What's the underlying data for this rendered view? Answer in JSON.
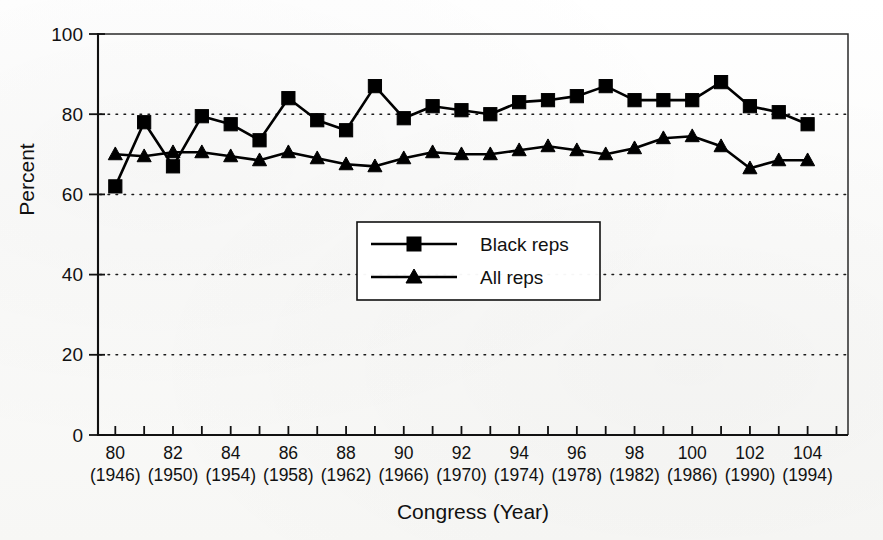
{
  "figure": {
    "background_color": "#ffffff",
    "ink_color": "#000000"
  },
  "chart_data": {
    "type": "line",
    "title": "",
    "xlabel": "Congress (Year)",
    "ylabel": "Percent",
    "ylim": [
      0,
      100
    ],
    "xlim": [
      79.4,
      105.4
    ],
    "grid": "horizontal-dotted",
    "legend_position": "center",
    "ytick_labels": [
      "0",
      "20",
      "40",
      "60",
      "80",
      "100"
    ],
    "ytick_values": [
      0,
      20,
      40,
      60,
      80,
      100
    ],
    "xtick_congress": [
      "80",
      "82",
      "84",
      "86",
      "88",
      "90",
      "92",
      "94",
      "96",
      "98",
      "100",
      "102",
      "104"
    ],
    "xtick_years": [
      "(1946)",
      "(1950)",
      "(1954)",
      "(1958)",
      "(1962)",
      "(1966)",
      "(1970)",
      "(1974)",
      "(1978)",
      "(1982)",
      "(1986)",
      "(1990)",
      "(1994)"
    ],
    "x": [
      80,
      81,
      82,
      83,
      84,
      85,
      86,
      87,
      88,
      89,
      90,
      91,
      92,
      93,
      94,
      95,
      96,
      97,
      98,
      99,
      100,
      101,
      102,
      103,
      104
    ],
    "series": [
      {
        "name": "Black reps",
        "marker": "square",
        "values": [
          62,
          78,
          67,
          79.5,
          77.5,
          73.5,
          84,
          78.5,
          76,
          87,
          79,
          82,
          81,
          80,
          83,
          83.5,
          84.5,
          87,
          83.5,
          83.5,
          83.5,
          88,
          82,
          80.5,
          77.5
        ]
      },
      {
        "name": "All reps",
        "marker": "triangle",
        "values": [
          70,
          69.5,
          70.5,
          70.5,
          69.5,
          68.5,
          70.5,
          69,
          67.5,
          67,
          69,
          70.5,
          70,
          70,
          71,
          72,
          71,
          70,
          71.5,
          74,
          74.5,
          72,
          66.5,
          68.5,
          68.5
        ]
      }
    ]
  },
  "legend": {
    "entries": [
      {
        "label": "Black reps",
        "marker": "square"
      },
      {
        "label": "All reps",
        "marker": "triangle"
      }
    ]
  }
}
